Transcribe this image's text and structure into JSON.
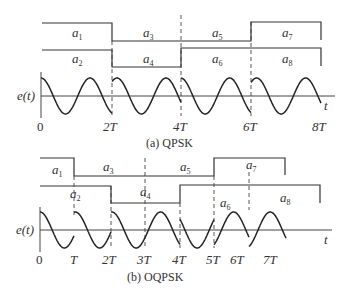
{
  "panel_a": {
    "caption": "(a)  QPSK",
    "y_label": "e(t)",
    "x_label": "t",
    "ticks": [
      "0",
      "2T",
      "4T",
      "6T",
      "8T"
    ],
    "upper_symbols": [
      "a1",
      "a3",
      "a5",
      "a7"
    ],
    "lower_symbols": [
      "a2",
      "a4",
      "a6",
      "a8"
    ]
  },
  "panel_b": {
    "caption": "(b)  OQPSK",
    "y_label": "e(t)",
    "x_label": "t",
    "ticks": [
      "0",
      "T",
      "2T",
      "3T",
      "4T",
      "5T",
      "6T",
      "7T"
    ],
    "upper_symbols": [
      "a1",
      "a3",
      "a5",
      "a7"
    ],
    "lower_symbols": [
      "a2",
      "a4",
      "a6",
      "a8"
    ]
  }
}
